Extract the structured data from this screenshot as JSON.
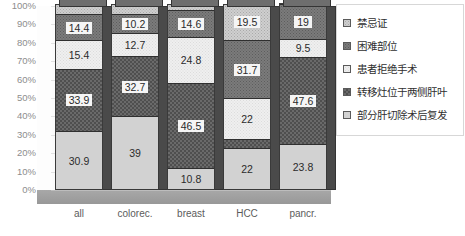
{
  "chart_data": {
    "type": "bar",
    "subtype": "stacked-percent-3d",
    "title": "",
    "xlabel": "",
    "ylabel": "",
    "categories": [
      "all",
      "colorec.",
      "breast",
      "HCC",
      "pancr."
    ],
    "ylim": [
      0,
      100
    ],
    "ytick_labels": [
      "100%",
      "90%",
      "80%",
      "70%",
      "60%",
      "50%",
      "40%",
      "30%",
      "20%",
      "10%",
      "0%"
    ],
    "ytick_values": [
      100,
      90,
      80,
      70,
      60,
      50,
      40,
      30,
      20,
      10,
      0
    ],
    "grid": true,
    "legend_position": "right",
    "stack_order": "bottom-to-top",
    "series": [
      {
        "name": "部分肝切除术后复发",
        "key": "recurrence-after-partial-hepatectomy",
        "fill": "light-gray-solid",
        "values": [
          30.9,
          39,
          10.8,
          22,
          23.8
        ],
        "labels": [
          "30.9",
          "39",
          "10.8",
          "22",
          "23.8"
        ]
      },
      {
        "name": "转移灶位于两侧肝叶",
        "key": "bilobar-metastases",
        "fill": "dark-checker",
        "values": [
          33.9,
          32.7,
          46.5,
          4.8,
          47.6
        ],
        "labels": [
          "33.9",
          "32.7",
          "46.5",
          "",
          "47.6"
        ]
      },
      {
        "name": "患者拒绝手术",
        "key": "patient-refused-surgery",
        "fill": "very-light-speckle",
        "values": [
          15.4,
          12.7,
          24.8,
          22,
          9.5
        ],
        "labels": [
          "15.4",
          "12.7",
          "24.8",
          "22",
          "9.5"
        ]
      },
      {
        "name": "困难部位",
        "key": "difficult-location",
        "fill": "medium-dark-speckle",
        "values": [
          14.4,
          10.2,
          14.6,
          31.7,
          19
        ],
        "labels": [
          "14.4",
          "10.2",
          "14.6",
          "31.7",
          "19"
        ]
      },
      {
        "name": "禁忌证",
        "key": "contraindication",
        "fill": "light-speckle",
        "values": [
          5.4,
          5.4,
          3.3,
          19.5,
          0.1
        ],
        "labels": [
          "",
          "",
          "",
          "19.5",
          ""
        ]
      }
    ]
  },
  "legend": {
    "items": [
      {
        "label": "禁忌证",
        "swatch": "light-speckle"
      },
      {
        "label": "困难部位",
        "swatch": "medium-dark-speckle"
      },
      {
        "label": "患者拒绝手术",
        "swatch": "very-light-speckle"
      },
      {
        "label": "转移灶位于两侧肝叶",
        "swatch": "dark-checker"
      },
      {
        "label": "部分肝切除术后复发",
        "swatch": "light-gray-solid"
      }
    ]
  },
  "colors": {
    "plot_background": "#fbfbfb",
    "floor": "#9c9c9c",
    "gridline": "#e2e2e2",
    "axis_text": "#8d8d8d",
    "category_text": "#5c5c5c",
    "bar_outline": "#3a3a3a",
    "series_recurrence": "#d2d2d2",
    "series_bilobar": "#6a6a6a",
    "series_refused": "#efefef",
    "series_difficult": "#7b7b7b",
    "series_contraindication": "#cfcfcf"
  }
}
